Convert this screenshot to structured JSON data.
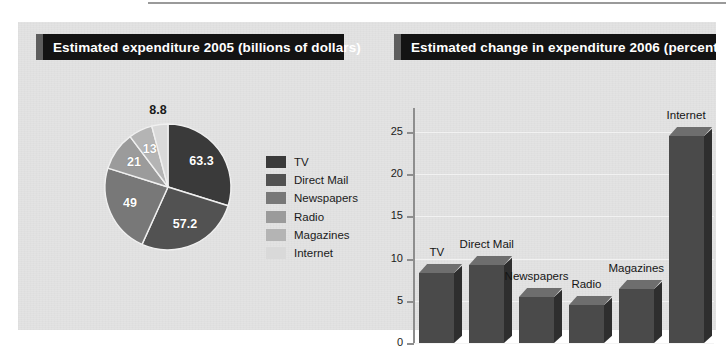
{
  "panel": {
    "background_color": "#e3e3e3",
    "accent_color": "#131313",
    "banner_edge_color": "#5e5e5e"
  },
  "pie_panel": {
    "title": "Estimated expenditure 2005 (billions of dollars)"
  },
  "bar_panel": {
    "title": "Estimated change in expenditure 2006 (percentage)"
  },
  "legend": {
    "items": [
      {
        "label": "TV",
        "color": "#3a3a3a"
      },
      {
        "label": "Direct Mail",
        "color": "#525252"
      },
      {
        "label": "Newspapers",
        "color": "#787878"
      },
      {
        "label": "Radio",
        "color": "#9b9b9b"
      },
      {
        "label": "Magazines",
        "color": "#b4b4b4"
      },
      {
        "label": "Internet",
        "color": "#d9d9d9"
      }
    ]
  },
  "chart_data": [
    {
      "type": "pie",
      "title": "Estimated expenditure 2005 (billions of dollars)",
      "unit": "billions of dollars",
      "categories": [
        "TV",
        "Direct Mail",
        "Newspapers",
        "Radio",
        "Magazines",
        "Internet"
      ],
      "values": [
        63.3,
        57.2,
        49,
        21,
        13,
        8.8
      ],
      "labels": [
        "63.3",
        "57.2",
        "49",
        "21",
        "13",
        "8.8"
      ],
      "colors": [
        "#3a3a3a",
        "#525252",
        "#787878",
        "#9b9b9b",
        "#b4b4b4",
        "#d9d9d9"
      ],
      "total": 212.3,
      "start_angle_deg": 0,
      "direction": "clockwise",
      "legend": "right",
      "label_positions": [
        "inside",
        "inside",
        "inside",
        "inside",
        "inside",
        "outside"
      ]
    },
    {
      "type": "bar",
      "title": "Estimated change in expenditure 2006 (percentage)",
      "categories": [
        "TV",
        "Direct Mail",
        "Newspapers",
        "Radio",
        "Magazines",
        "Internet"
      ],
      "values": [
        8.3,
        9.3,
        5.4,
        4.5,
        6.4,
        24.5
      ],
      "xlabel": "",
      "ylabel": "",
      "ylim": [
        0,
        26
      ],
      "yticks": [
        0,
        5,
        10,
        15,
        20,
        25
      ],
      "ytick_labels": [
        "0",
        "5",
        "10",
        "15",
        "20",
        "25"
      ],
      "grid": true,
      "grid_color": "#f2f2f2",
      "legend": "none",
      "bar_style": "3d",
      "bar_colors": {
        "front": "#4a4a4a",
        "top": "#6e6e6e",
        "side": "#2e2e2e"
      },
      "data_labels_on_bars": [
        "TV",
        "Direct Mail",
        "Newspapers",
        "Radio",
        "Magazines",
        "Internet"
      ]
    }
  ]
}
